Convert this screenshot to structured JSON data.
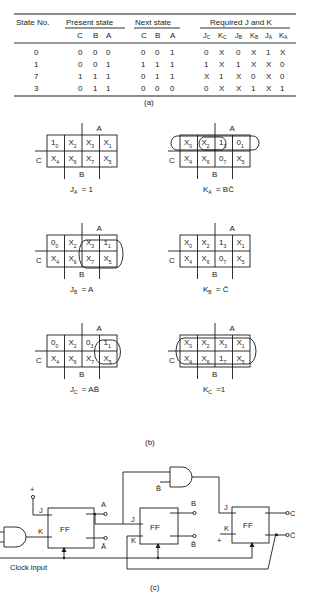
{
  "table": {
    "headers": {
      "state_no": "State No.",
      "present_state": "Present state",
      "next_state": "Next state",
      "required": "Required J and K"
    },
    "sub_headers": {
      "present": [
        "C",
        "B",
        "A"
      ],
      "next": [
        "C",
        "B",
        "A"
      ],
      "jk": [
        "J",
        "K",
        "J",
        "K",
        "J",
        "K"
      ],
      "jk_subs": [
        "C",
        "C",
        "B",
        "B",
        "A",
        "A"
      ]
    },
    "rows": [
      {
        "state": "0",
        "present": [
          "0",
          "0",
          "0"
        ],
        "next": [
          "0",
          "0",
          "1"
        ],
        "jk": [
          "0",
          "X",
          "0",
          "X",
          "1",
          "X"
        ]
      },
      {
        "state": "1",
        "present": [
          "0",
          "0",
          "1"
        ],
        "next": [
          "1",
          "1",
          "1"
        ],
        "jk": [
          "1",
          "X",
          "1",
          "X",
          "X",
          "0"
        ]
      },
      {
        "state": "7",
        "present": [
          "1",
          "1",
          "1"
        ],
        "next": [
          "0",
          "1",
          "1"
        ],
        "jk": [
          "X",
          "1",
          "X",
          "0",
          "X",
          "0"
        ]
      },
      {
        "state": "3",
        "present": [
          "0",
          "1",
          "1"
        ],
        "next": [
          "0",
          "0",
          "0"
        ],
        "jk": [
          "0",
          "X",
          "X",
          "1",
          "X",
          "1"
        ]
      }
    ],
    "caption": "(a)"
  },
  "kmaps": {
    "axis_labels": {
      "a": "A",
      "b": "B",
      "c": "C"
    },
    "maps": [
      {
        "id": "ja",
        "top": [
          [
            "1",
            "0"
          ],
          [
            "X",
            "2"
          ],
          [
            "X",
            "3"
          ],
          [
            "X",
            "1"
          ]
        ],
        "bottom": [
          [
            "X",
            "4"
          ],
          [
            "X",
            "6"
          ],
          [
            "X",
            "7"
          ],
          [
            "X",
            "5"
          ]
        ],
        "eq_main": "J",
        "eq_sub": "A",
        "eq_rhs": "= 1"
      },
      {
        "id": "ka",
        "top": [
          [
            "X",
            "0"
          ],
          [
            "X",
            "2"
          ],
          [
            "1",
            "3"
          ],
          [
            "0",
            "1"
          ]
        ],
        "bottom": [
          [
            "X",
            "4"
          ],
          [
            "X",
            "6"
          ],
          [
            "0",
            "7"
          ],
          [
            "X",
            "5"
          ]
        ],
        "eq_main": "K",
        "eq_sub": "A",
        "eq_rhs": "= BC̄"
      },
      {
        "id": "jb",
        "top": [
          [
            "0",
            "0"
          ],
          [
            "X",
            "2"
          ],
          [
            "X",
            "3"
          ],
          [
            "1",
            "1"
          ]
        ],
        "bottom": [
          [
            "X",
            "4"
          ],
          [
            "X",
            "6"
          ],
          [
            "X",
            "7"
          ],
          [
            "X",
            "5"
          ]
        ],
        "eq_main": "J",
        "eq_sub": "B",
        "eq_rhs": "= A"
      },
      {
        "id": "kb",
        "top": [
          [
            "X",
            "0"
          ],
          [
            "X",
            "2"
          ],
          [
            "1",
            "3"
          ],
          [
            "X",
            "1"
          ]
        ],
        "bottom": [
          [
            "X",
            "4"
          ],
          [
            "X",
            "6"
          ],
          [
            "0",
            "7"
          ],
          [
            "X",
            "5"
          ]
        ],
        "eq_main": "K",
        "eq_sub": "B",
        "eq_rhs": "= C̄"
      },
      {
        "id": "jc",
        "top": [
          [
            "0",
            "0"
          ],
          [
            "X",
            "2"
          ],
          [
            "0",
            "3"
          ],
          [
            "1",
            "1"
          ]
        ],
        "bottom": [
          [
            "X",
            "4"
          ],
          [
            "X",
            "6"
          ],
          [
            "X",
            "7"
          ],
          [
            "X",
            "5"
          ]
        ],
        "eq_main": "J",
        "eq_sub": "C",
        "eq_rhs": "= AB̄"
      },
      {
        "id": "kc",
        "top": [
          [
            "X",
            "0"
          ],
          [
            "X",
            "2"
          ],
          [
            "X",
            "3"
          ],
          [
            "X",
            "1"
          ]
        ],
        "bottom": [
          [
            "X",
            "4"
          ],
          [
            "X",
            "6"
          ],
          [
            "1",
            "7"
          ],
          [
            "X",
            "5"
          ]
        ],
        "eq_main": "K",
        "eq_sub": "C",
        "eq_rhs": "=1"
      }
    ],
    "caption": "(b)"
  },
  "circuit": {
    "ff_label": "FF",
    "j": "J",
    "k": "K",
    "plus": "+",
    "outputs": {
      "a": "A",
      "a_bar": "Ā",
      "b": "B",
      "b_bar": "B̄",
      "c": "C",
      "c_bar": "C̄",
      "gate_input_b_bar": "B̄"
    },
    "clock_label": "Clock input",
    "caption": "(c)"
  }
}
